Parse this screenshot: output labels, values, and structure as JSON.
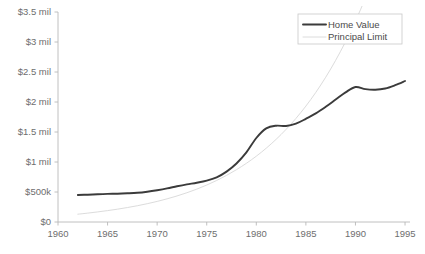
{
  "chart_data": {
    "type": "line",
    "title": "",
    "subtitle": "",
    "xlabel": "",
    "ylabel": "",
    "xlim": [
      1960,
      1995.5
    ],
    "ylim": [
      0,
      3500000
    ],
    "grid": false,
    "legend_position": "top-right",
    "x_tick_labels": [
      "1960",
      "1965",
      "1970",
      "1975",
      "1980",
      "1985",
      "1990",
      "1995"
    ],
    "x_tick_values": [
      1960,
      1965,
      1970,
      1975,
      1980,
      1985,
      1990,
      1995
    ],
    "y_tick_labels": [
      "$0",
      "$500k",
      "$1 mil",
      "$1.5 mil",
      "$2 mil",
      "$2.5 mil",
      "$3 mil",
      "$3.5 mil"
    ],
    "y_tick_values": [
      0,
      500000,
      1000000,
      1500000,
      2000000,
      2500000,
      3000000,
      3500000
    ],
    "series": [
      {
        "name": "Home Value",
        "color": "#3b3b3b",
        "line_width": 1.9,
        "x": [
          1962,
          1963,
          1964,
          1965,
          1966,
          1967,
          1968,
          1969,
          1970,
          1971,
          1972,
          1973,
          1974,
          1975,
          1976,
          1977,
          1978,
          1979,
          1980,
          1981,
          1982,
          1983,
          1984,
          1985,
          1986,
          1987,
          1988,
          1989,
          1990,
          1991,
          1992,
          1993,
          1994,
          1995
        ],
        "values": [
          450000,
          455000,
          462000,
          468000,
          472000,
          478000,
          487000,
          505000,
          530000,
          560000,
          596000,
          628000,
          655000,
          690000,
          745000,
          840000,
          975000,
          1160000,
          1400000,
          1560000,
          1605000,
          1600000,
          1640000,
          1720000,
          1810000,
          1920000,
          2040000,
          2160000,
          2250000,
          2215000,
          2205000,
          2225000,
          2280000,
          2350000
        ]
      },
      {
        "name": "Principal Limit",
        "color": "#dcdcdc",
        "line_width": 1.0,
        "x": [
          1962,
          1963,
          1964,
          1965,
          1966,
          1967,
          1968,
          1969,
          1970,
          1971,
          1972,
          1973,
          1974,
          1975,
          1976,
          1977,
          1978,
          1979,
          1980,
          1981,
          1982,
          1983,
          1984,
          1985,
          1986,
          1987,
          1988,
          1989,
          1990,
          1991,
          1992,
          1993,
          1994,
          1995
        ],
        "values": [
          130000,
          148000,
          168000,
          190000,
          214000,
          241000,
          271000,
          305000,
          343000,
          386000,
          434000,
          488000,
          548000,
          616000,
          692000,
          777000,
          872000,
          978000,
          1097000,
          1230000,
          1378000,
          1543000,
          1727000,
          1932000,
          2160000,
          2413000,
          2694000,
          3005000,
          3350000,
          3730000,
          4150000,
          4610000,
          5120000,
          5680000
        ]
      }
    ],
    "annotations": []
  },
  "legend": {
    "entries": [
      {
        "label": "Home Value"
      },
      {
        "label": "Principal Limit"
      }
    ]
  },
  "colors": {
    "home_value": "#3b3b3b",
    "principal_limit": "#dcdcdc",
    "axis": "#b9b9b9",
    "tick_text": "#6e6e6e",
    "legend_text": "#4a4a4a",
    "legend_border": "#c8c8c8",
    "background": "#ffffff"
  }
}
